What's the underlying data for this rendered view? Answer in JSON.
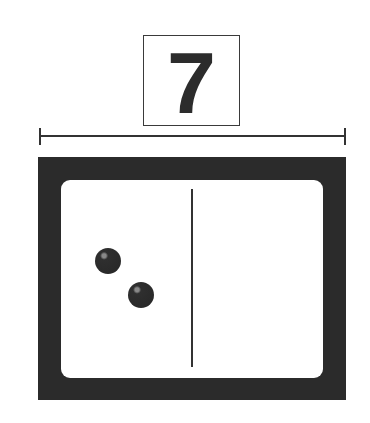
{
  "number_card": {
    "value": "7"
  },
  "domino": {
    "left_half": {
      "pips": 2
    },
    "right_half": {
      "pips": 0
    }
  },
  "colors": {
    "frame": "#2b2b2b",
    "line": "#333333",
    "face": "#ffffff"
  }
}
